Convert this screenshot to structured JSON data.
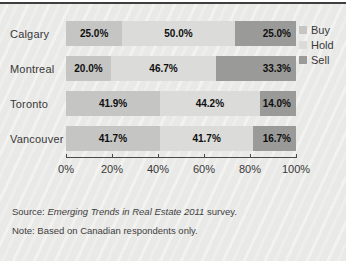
{
  "chart_data": {
    "type": "bar",
    "orientation": "horizontal",
    "stacked": true,
    "categories": [
      "Calgary",
      "Montreal",
      "Toronto",
      "Vancouver"
    ],
    "series": [
      {
        "name": "Buy",
        "color": "#c5c5c3",
        "values": [
          25.0,
          20.0,
          41.9,
          41.7
        ],
        "labels": [
          "25.0%",
          "20.0%",
          "41.9%",
          "41.7%"
        ]
      },
      {
        "name": "Hold",
        "color": "#dbdbd9",
        "values": [
          50.0,
          46.7,
          44.2,
          41.7
        ],
        "labels": [
          "50.0%",
          "46.7%",
          "44.2%",
          "41.7%"
        ]
      },
      {
        "name": "Sell",
        "color": "#9a9a98",
        "values": [
          25.0,
          33.3,
          14.0,
          16.7
        ],
        "labels": [
          "25.0%",
          "33.3%",
          "14.0%",
          "16.7%"
        ]
      }
    ],
    "xticks": [
      "0%",
      "20%",
      "40%",
      "60%",
      "80%",
      "100%"
    ],
    "xlim": [
      0,
      100
    ],
    "legend_position": "right-top",
    "grid": false
  },
  "footer": {
    "source_prefix": "Source: ",
    "source_italic": "Emerging Trends in Real Estate 2011",
    "source_suffix": " survey.",
    "note": "Note: Based on Canadian respondents only."
  }
}
